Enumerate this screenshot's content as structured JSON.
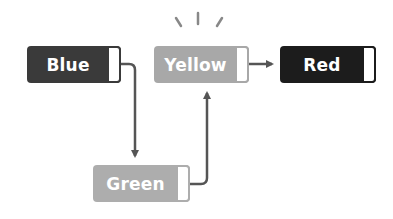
{
  "diagram": {
    "nodes": [
      {
        "id": "blue",
        "label": "Blue",
        "color": "#3a3a3a"
      },
      {
        "id": "yellow",
        "label": "Yellow",
        "color": "#a8a8a8"
      },
      {
        "id": "red",
        "label": "Red",
        "color": "#1c1c1c"
      },
      {
        "id": "green",
        "label": "Green",
        "color": "#adadad"
      }
    ],
    "edges": [
      {
        "from": "Blue",
        "to": "Green"
      },
      {
        "from": "Green",
        "to": "Yellow"
      },
      {
        "from": "Yellow",
        "to": "Red"
      }
    ],
    "highlight": "Yellow",
    "line_color": "#555555"
  }
}
